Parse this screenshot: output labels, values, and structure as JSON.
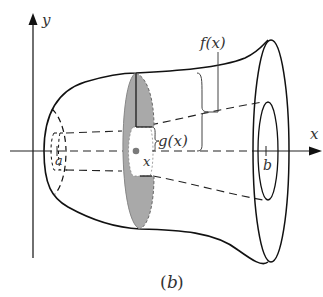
{
  "figure": {
    "caption_open": "(",
    "caption_var": "b",
    "caption_close": ")",
    "labels": {
      "y_axis": "y",
      "x_axis": "x",
      "lower_bound": "a",
      "upper_bound": "b",
      "slice_position": "x",
      "outer_radius": "f(x)",
      "inner_radius": "g(x)"
    },
    "colors": {
      "stroke": "#111111",
      "disk_fill": "#a9a9a9",
      "hole_fill": "#ffffff",
      "center_dot": "#7a7a7a",
      "label": "#333333"
    }
  }
}
